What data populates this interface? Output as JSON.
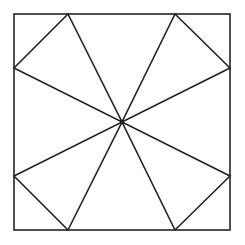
{
  "diagram": {
    "type": "geometric-figure",
    "canvas": {
      "width": 245,
      "height": 245,
      "background": "#ffffff"
    },
    "stroke": {
      "color": "#222222",
      "width": 1.6
    },
    "square": {
      "x1": 14,
      "y1": 14,
      "x2": 230,
      "y2": 230
    },
    "center": {
      "x": 122,
      "y": 122
    },
    "edge_points": {
      "top_left": {
        "x": 68,
        "y": 14
      },
      "top_right": {
        "x": 175,
        "y": 14
      },
      "right_top": {
        "x": 230,
        "y": 68
      },
      "right_bottom": {
        "x": 230,
        "y": 176
      },
      "bottom_right": {
        "x": 175,
        "y": 230
      },
      "bottom_left": {
        "x": 68,
        "y": 230
      },
      "left_bottom": {
        "x": 14,
        "y": 176
      },
      "left_top": {
        "x": 14,
        "y": 68
      }
    },
    "triangles": [
      {
        "name": "top-left-triangle",
        "points": [
          [
            14,
            68
          ],
          [
            68,
            14
          ],
          [
            122,
            122
          ]
        ]
      },
      {
        "name": "top-right-triangle",
        "points": [
          [
            175,
            14
          ],
          [
            230,
            68
          ],
          [
            122,
            122
          ]
        ]
      },
      {
        "name": "bottom-right-triangle",
        "points": [
          [
            230,
            176
          ],
          [
            175,
            230
          ],
          [
            122,
            122
          ]
        ]
      },
      {
        "name": "bottom-left-triangle",
        "points": [
          [
            68,
            230
          ],
          [
            14,
            176
          ],
          [
            122,
            122
          ]
        ]
      }
    ]
  }
}
